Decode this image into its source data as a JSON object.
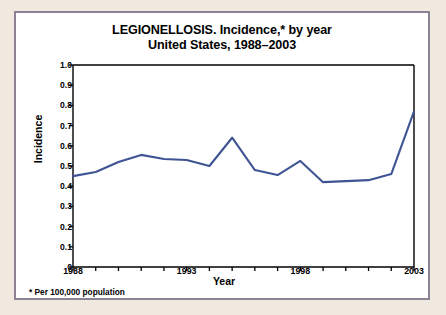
{
  "title": {
    "line1": "LEGIONELLOSIS.  Incidence,* by year",
    "line2": "United States, 1988–2003"
  },
  "footnote": "* Per 100,000 population",
  "colors": {
    "line": "#3f5494",
    "border": "#8d8294",
    "page_background": "#efe9e0",
    "card_background": "#ffffff",
    "axis": "#000000"
  },
  "chart_data": {
    "type": "line",
    "title": "LEGIONELLOSIS.  Incidence,* by year United States, 1988–2003",
    "xlabel": "Year",
    "ylabel": "Incidence",
    "xlim": [
      1988,
      2003
    ],
    "ylim": [
      0,
      1.0
    ],
    "grid": false,
    "legend": "none",
    "x": [
      1988,
      1989,
      1990,
      1991,
      1992,
      1993,
      1994,
      1995,
      1996,
      1997,
      1998,
      1999,
      2000,
      2001,
      2002,
      2003
    ],
    "values": [
      0.45,
      0.47,
      0.52,
      0.555,
      0.535,
      0.53,
      0.5,
      0.64,
      0.48,
      0.455,
      0.525,
      0.42,
      0.425,
      0.43,
      0.46,
      0.77
    ],
    "ytick_labels": [
      "1.0",
      "0.9",
      "0.8",
      "0.7",
      "0.6",
      "0.5",
      "0.4",
      "0.3",
      "0.2",
      "0.1",
      "0"
    ],
    "ytick_values": [
      1.0,
      0.9,
      0.8,
      0.7,
      0.6,
      0.5,
      0.4,
      0.3,
      0.2,
      0.1,
      0
    ],
    "xtick_labels": [
      "1988",
      "1993",
      "1998",
      "2003"
    ],
    "xtick_values": [
      1988,
      1993,
      1998,
      2003
    ]
  }
}
